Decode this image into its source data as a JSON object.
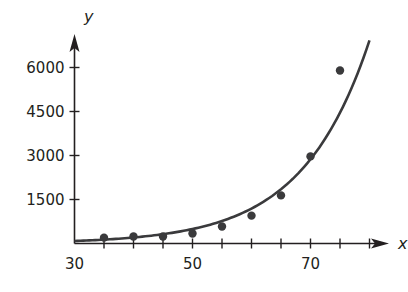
{
  "chart_data": {
    "type": "scatter",
    "title": "",
    "xlabel": "x",
    "ylabel": "y",
    "xlim": [
      30,
      82
    ],
    "ylim": [
      0,
      7000
    ],
    "x_ticks": [
      30,
      35,
      40,
      45,
      50,
      55,
      60,
      65,
      70,
      75,
      80
    ],
    "x_tick_labels": [
      "30",
      "50",
      "70"
    ],
    "x_tick_label_values": [
      30,
      50,
      70
    ],
    "y_ticks": [
      1500,
      3000,
      4500,
      6000
    ],
    "y_tick_labels": [
      "1500",
      "3000",
      "4500",
      "6000"
    ],
    "grid": false,
    "legend": null,
    "series": [
      {
        "name": "data points",
        "type": "scatter",
        "x": [
          35,
          40,
          45,
          50,
          55,
          60,
          65,
          70,
          75
        ],
        "y": [
          200,
          240,
          240,
          340,
          580,
          950,
          1640,
          2970,
          5900
        ]
      },
      {
        "name": "exponential fit",
        "type": "line",
        "equation": "y = 85 * e^(0.088*(x-30))",
        "a": 85,
        "b": 0.088,
        "x_range": [
          30,
          80
        ]
      }
    ],
    "colors": {
      "ink": "#231f20",
      "points": "#3a3a3c",
      "curve": "#3a3a3c"
    }
  }
}
